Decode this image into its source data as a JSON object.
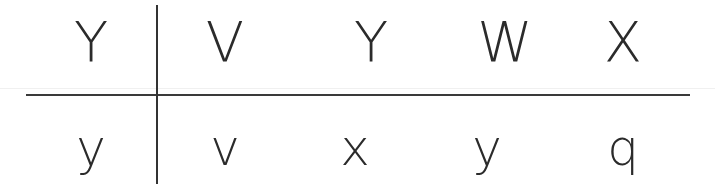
{
  "table": {
    "header_row": [
      "Y",
      "V",
      "Y",
      "W",
      "X"
    ],
    "answer_row": [
      "y",
      "v",
      "x",
      "y",
      "q"
    ]
  }
}
